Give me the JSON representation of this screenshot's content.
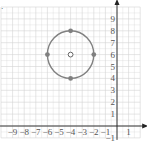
{
  "chart_data": {
    "type": "scatter",
    "title": "",
    "problem_marker": ".",
    "xlabel": "x",
    "ylabel": "y",
    "xlim": [
      -10,
      2
    ],
    "ylim": [
      -1,
      10
    ],
    "grid": true,
    "x_ticks": [
      "-9",
      "-8",
      "-7",
      "-6",
      "-5",
      "-4",
      "-3",
      "-2",
      "-1",
      "1"
    ],
    "y_ticks": [
      "-1",
      "1",
      "2",
      "3",
      "4",
      "5",
      "6",
      "7",
      "8",
      "9"
    ],
    "circle": {
      "center": [
        -4,
        6
      ],
      "radius": 2,
      "color": "#808080"
    },
    "center_point": {
      "x": -4,
      "y": 6,
      "style": "open"
    },
    "points": [
      {
        "x": -4,
        "y": 8,
        "style": "filled"
      },
      {
        "x": -2,
        "y": 6,
        "style": "filled"
      },
      {
        "x": -4,
        "y": 4,
        "style": "filled"
      },
      {
        "x": -6,
        "y": 6,
        "style": "filled"
      }
    ],
    "colors": {
      "curve": "#808080",
      "grid": "#d4d4d4",
      "axis": "#222222"
    }
  }
}
